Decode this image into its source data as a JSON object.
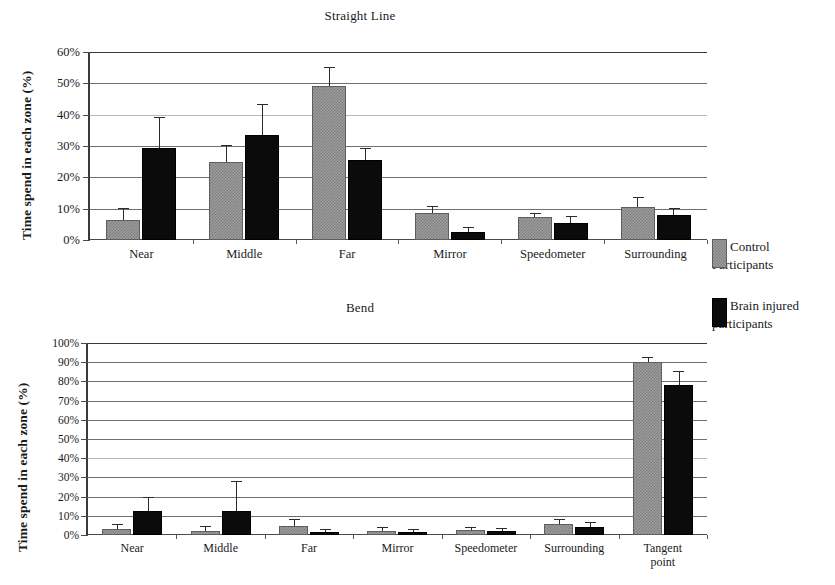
{
  "figure": {
    "legend": {
      "entries": [
        {
          "key": "control",
          "label": "Control\nParticipants",
          "color": "#9c9c9c",
          "swatch_name": "legend-swatch-control"
        },
        {
          "key": "injured",
          "label": "Brain injured\nparticipants",
          "color": "#0b0b0b",
          "swatch_name": "legend-swatch-injured"
        }
      ]
    }
  },
  "chart_data": [
    {
      "id": "straight-line",
      "type": "bar",
      "title": "Straight Line",
      "xlabel": "",
      "ylabel": "Time spend in each zone (%)",
      "ylim": [
        0,
        60
      ],
      "ytick_labels": [
        "0%",
        "10%",
        "20%",
        "30%",
        "40%",
        "50%",
        "60%"
      ],
      "ytick_values": [
        0,
        10,
        20,
        30,
        40,
        50,
        60
      ],
      "grid": true,
      "legend_position": "right",
      "categories": [
        "Near",
        "Middle",
        "Far",
        "Mirror",
        "Speedometer",
        "Surrounding"
      ],
      "series": [
        {
          "name": "Control Participants",
          "key": "control",
          "color": "#9c9c9c",
          "values": [
            6.5,
            25.0,
            49.0,
            8.5,
            7.5,
            10.5
          ],
          "errors": [
            3.5,
            5.0,
            6.0,
            2.0,
            0.8,
            3.0
          ]
        },
        {
          "name": "Brain injured participants",
          "key": "injured",
          "color": "#0b0b0b",
          "values": [
            29.5,
            33.5,
            25.5,
            2.5,
            5.5,
            8.0
          ],
          "errors": [
            9.5,
            9.5,
            3.5,
            1.2,
            2.0,
            2.0
          ]
        }
      ]
    },
    {
      "id": "bend",
      "type": "bar",
      "title": "Bend",
      "xlabel": "",
      "ylabel": "Time spend in each zone (%)",
      "ylim": [
        0,
        100
      ],
      "ytick_labels": [
        "0%",
        "10%",
        "20%",
        "30%",
        "40%",
        "50%",
        "60%",
        "70%",
        "80%",
        "90%",
        "100%"
      ],
      "ytick_values": [
        0,
        10,
        20,
        30,
        40,
        50,
        60,
        70,
        80,
        90,
        100
      ],
      "grid": true,
      "legend_position": "right",
      "categories": [
        "Near",
        "Middle",
        "Far",
        "Mirror",
        "Speedometer",
        "Surrounding",
        "Tangent\npoint"
      ],
      "series": [
        {
          "name": "Control Participants",
          "key": "control",
          "color": "#9c9c9c",
          "values": [
            3.0,
            2.0,
            4.5,
            2.0,
            2.5,
            5.5,
            90.0
          ],
          "errors": [
            2.0,
            2.0,
            3.5,
            1.5,
            1.0,
            2.5,
            2.0
          ]
        },
        {
          "name": "Brain injured participants",
          "key": "injured",
          "color": "#0b0b0b",
          "values": [
            12.5,
            12.5,
            1.5,
            1.5,
            2.0,
            4.0,
            78.0
          ],
          "errors": [
            7.0,
            15.0,
            1.0,
            1.0,
            1.0,
            2.5,
            7.0
          ]
        }
      ]
    }
  ]
}
